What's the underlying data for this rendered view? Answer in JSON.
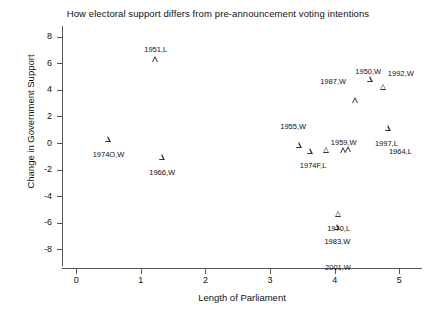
{
  "chart_data": {
    "type": "scatter",
    "title": "How electoral support differs from pre-announcement voting intentions",
    "xlabel": "Length of Parliament",
    "ylabel": "Change in Government Support",
    "xlim": [
      -0.22,
      5.35
    ],
    "ylim": [
      -9.4,
      8.8
    ],
    "xticks": [
      0,
      1,
      2,
      3,
      4,
      5
    ],
    "xtick_labels": [
      "0",
      "1",
      "2",
      "3",
      "4",
      "5"
    ],
    "yticks": [
      8,
      6,
      4,
      2,
      0,
      -2,
      -4,
      -6,
      -8
    ],
    "ytick_labels": [
      "8",
      "6",
      "4",
      "2",
      "0",
      "-2",
      "-4",
      "-6",
      "-8"
    ],
    "grid": false,
    "legend": "none",
    "marker": "open-triangle",
    "marker_color": "#333333",
    "points": [
      {
        "label": "1951,L",
        "x": 1.23,
        "y": 6.3,
        "label_dx": 0,
        "label_dy": -13,
        "align": "center"
      },
      {
        "label": "1950,W",
        "x": 4.55,
        "y": 4.8,
        "label_dx": -2,
        "label_dy": -11,
        "align": "center"
      },
      {
        "label": "1992,W",
        "x": 4.76,
        "y": 4.2,
        "label_dx": 4,
        "label_dy": -17,
        "align": "left"
      },
      {
        "label": "1987,W",
        "x": 4.33,
        "y": 3.2,
        "label_dx": -10,
        "label_dy": -22,
        "align": "right"
      },
      {
        "label": "1997,L",
        "x": 4.83,
        "y": 1.15,
        "label_dx": -2,
        "label_dy": 12,
        "align": "center"
      },
      {
        "label": "1964,L",
        "x": 4.83,
        "y": 1.15,
        "label_dx": 12,
        "label_dy": 20,
        "align": "center"
      },
      {
        "label": "1955,W",
        "x": 3.45,
        "y": -0.15,
        "label_dx": -6,
        "label_dy": -22,
        "align": "center"
      },
      {
        "label": "1974O,W",
        "x": 0.5,
        "y": 0.3,
        "label_dx": 0,
        "label_dy": 12,
        "align": "center"
      },
      {
        "label": "1974F,L",
        "x": 3.62,
        "y": -0.6,
        "label_dx": 3,
        "label_dy": 11,
        "align": "center"
      },
      {
        "label": "1959,W",
        "x": 4.14,
        "y": -0.55,
        "label_dx": 0,
        "label_dy": -11,
        "align": "center"
      },
      {
        "label": "1966,W",
        "x": 1.33,
        "y": -1.05,
        "label_dx": 0,
        "label_dy": 12,
        "align": "center"
      },
      {
        "label": "1970,L",
        "x": 4.06,
        "y": -5.35,
        "label_dx": 0,
        "label_dy": 11,
        "align": "center"
      },
      {
        "label": "1983,W",
        "x": 4.04,
        "y": -6.3,
        "label_dx": 0,
        "label_dy": 11,
        "align": "center"
      },
      {
        "label": "2001,W",
        "x": 4.05,
        "y": -8.95,
        "label_dx": 0,
        "label_dy": 2,
        "align": "center",
        "no_marker": true
      }
    ],
    "extra_markers": [
      {
        "x": 3.88,
        "y": -0.52
      },
      {
        "x": 4.22,
        "y": -0.48
      }
    ]
  }
}
